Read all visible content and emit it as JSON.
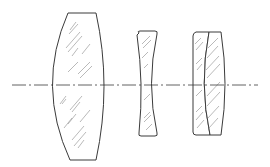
{
  "diagram": {
    "type": "optical-lens-cross-section",
    "colors": {
      "outline": "#3a3a3a",
      "hatch": "#8a8a8a",
      "background": "#ffffff"
    },
    "optical_axis": {
      "y": 85,
      "x_start": 12,
      "x_end": 258,
      "style": "dash-dot"
    },
    "elements": [
      {
        "id": "lens-1",
        "kind": "biconvex",
        "top_y": 13,
        "bottom_y": 160,
        "left_center_x": 52,
        "right_center_x": 104
      },
      {
        "id": "lens-2",
        "kind": "biconcave",
        "top_y": 33,
        "bottom_y": 135,
        "left_center_x": 141,
        "right_center_x": 152
      },
      {
        "id": "lens-3a",
        "kind": "cemented-doublet-front",
        "top_y": 32,
        "bottom_y": 135
      },
      {
        "id": "lens-3b",
        "kind": "cemented-doublet-rear",
        "top_y": 32,
        "bottom_y": 135
      }
    ]
  }
}
